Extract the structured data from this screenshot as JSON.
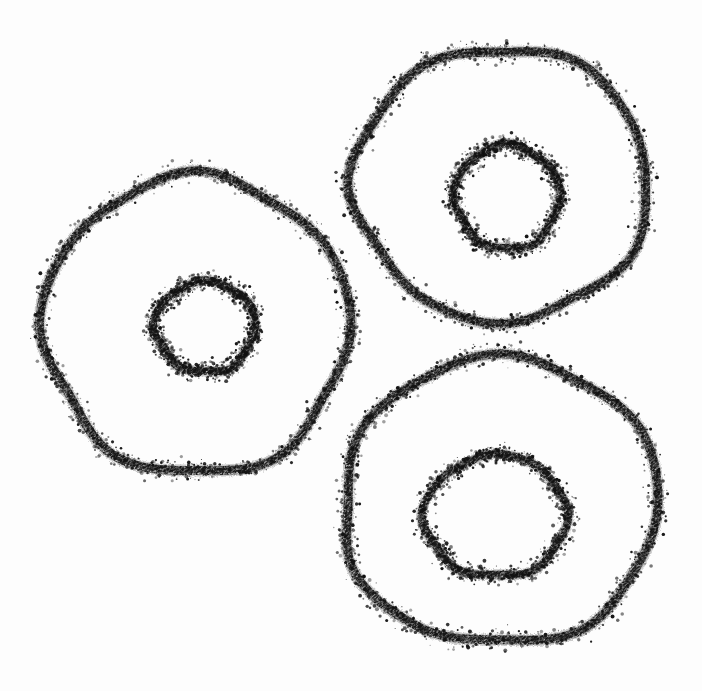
{
  "artwork": {
    "title": "Three concentric ring doodles",
    "medium": "charcoal / crayon on white paper",
    "background_color": "#fdfdfd",
    "ink_color": "#121212",
    "canvas": {
      "width": 702,
      "height": 691
    },
    "shape_count": 3,
    "alt_text": "A hand-drawn sketch showing three irregular concentric ring shapes, each made of a large wobbly outer circle with a smaller wobbly circle inside it, drawn in grainy black charcoal on white paper."
  },
  "shapes": [
    {
      "name": "left-ring",
      "label": "Left concentric ring",
      "outer": {
        "label": "outer circle",
        "center_x": 196,
        "center_y": 325,
        "radius_x": 152,
        "radius_y": 147,
        "stroke_width": 9,
        "bbox": [
          45,
          178,
          348,
          472
        ],
        "wobble": [
          1.02,
          0.97,
          1.05,
          0.99,
          1.04,
          0.96,
          1.03,
          1.0,
          0.98,
          1.05,
          0.97,
          1.01
        ]
      },
      "inner": {
        "label": "inner circle",
        "center_x": 205,
        "center_y": 327,
        "radius_x": 50,
        "radius_y": 45,
        "stroke_width": 8,
        "bbox": [
          155,
          282,
          255,
          372
        ],
        "wobble": [
          1.0,
          0.95,
          1.06,
          0.98,
          1.03,
          0.94,
          1.05,
          1.0,
          0.96,
          1.04,
          0.98,
          1.02
        ]
      }
    },
    {
      "name": "top-right-ring",
      "label": "Top-right concentric ring",
      "outer": {
        "label": "outer circle",
        "center_x": 501,
        "center_y": 184,
        "radius_x": 146,
        "radius_y": 136,
        "stroke_width": 9,
        "bbox": [
          355,
          48,
          648,
          320
        ],
        "wobble": [
          0.99,
          1.04,
          0.97,
          1.03,
          1.0,
          0.96,
          1.05,
          0.98,
          1.02,
          0.97,
          1.04,
          1.0
        ]
      },
      "inner": {
        "label": "inner circle",
        "center_x": 507,
        "center_y": 197,
        "radius_x": 52,
        "radius_y": 52,
        "stroke_width": 8,
        "bbox": [
          455,
          145,
          560,
          250
        ],
        "wobble": [
          1.03,
          0.96,
          1.05,
          0.98,
          1.02,
          0.95,
          1.04,
          1.0,
          0.97,
          1.03,
          0.96,
          1.01
        ]
      }
    },
    {
      "name": "bottom-right-ring",
      "label": "Bottom-right concentric ring",
      "outer": {
        "label": "outer circle",
        "center_x": 500,
        "center_y": 501,
        "radius_x": 158,
        "radius_y": 143,
        "stroke_width": 9,
        "bbox": [
          342,
          358,
          658,
          645
        ],
        "wobble": [
          1.0,
          0.98,
          1.04,
          0.97,
          1.02,
          1.05,
          0.96,
          1.01,
          0.98,
          1.03,
          0.97,
          1.02
        ]
      },
      "inner": {
        "label": "inner circle",
        "center_x": 496,
        "center_y": 516,
        "radius_x": 71,
        "radius_y": 61,
        "stroke_width": 8,
        "bbox": [
          425,
          455,
          567,
          578
        ],
        "wobble": [
          1.02,
          0.97,
          1.04,
          0.96,
          1.03,
          0.98,
          1.05,
          0.99,
          0.96,
          1.02,
          1.0,
          0.97
        ]
      }
    }
  ],
  "texture": {
    "grain_seed": 7,
    "grain_density": 0.62,
    "speckle_count_per_path": 900,
    "speckle_spread": 5.5,
    "min_dot": 0.5,
    "max_dot": 2.0
  }
}
